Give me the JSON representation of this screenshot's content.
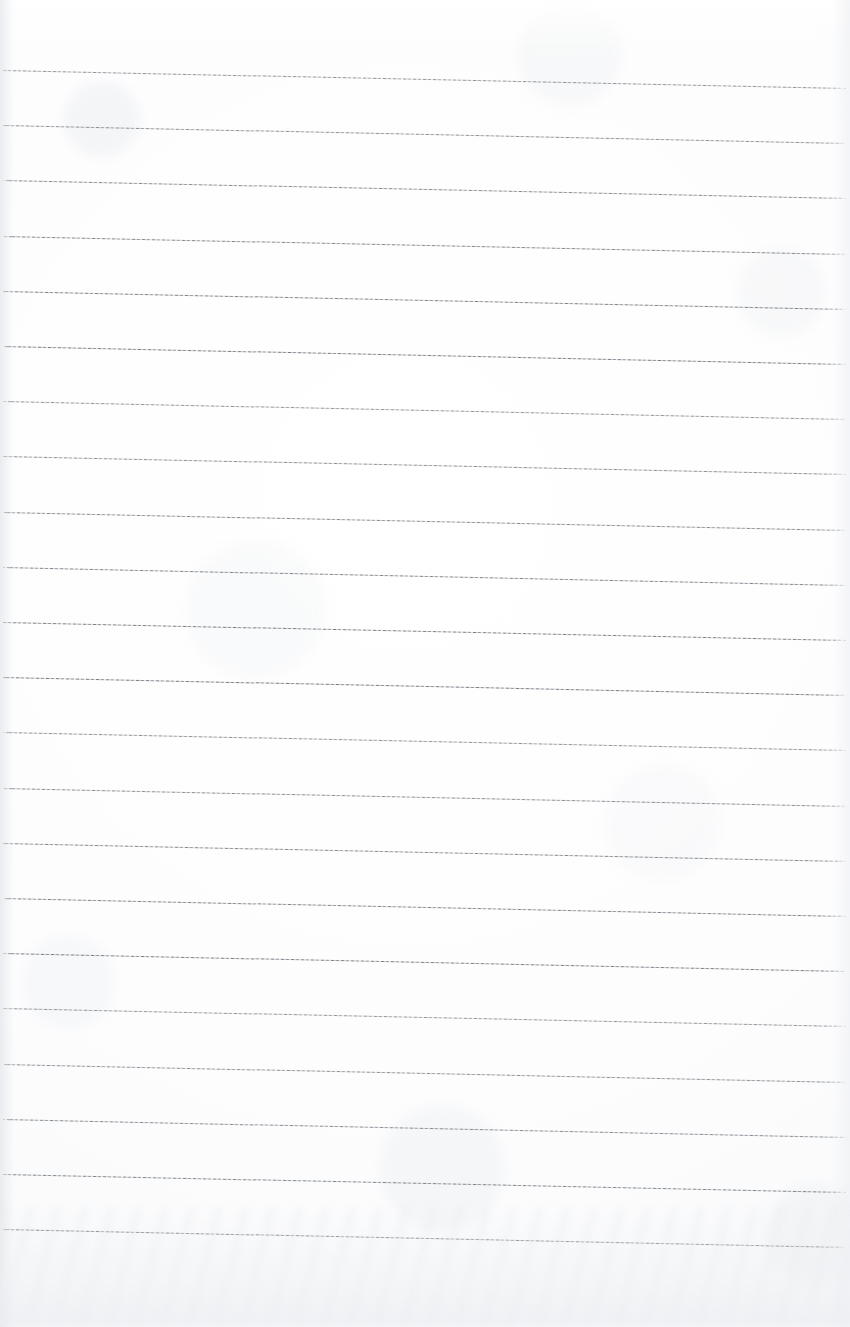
{
  "document": {
    "kind": "scanned-blank-lined-notebook-page",
    "page_width": 850,
    "page_height": 1327,
    "page_background_color": "#fdfdfd",
    "content_text": "",
    "has_handwriting": false,
    "has_header_text": false,
    "has_page_number": false
  },
  "ruling": {
    "style": "horizontal-ruled",
    "line_color": "#6d7178",
    "line_count": 22,
    "line_thickness_px": 1,
    "first_line_y": 70,
    "line_spacing_px": 55.2,
    "line_start_x": 3,
    "line_end_x": 846,
    "slant_drop_px": 18,
    "margin_rule": false,
    "line_y_positions": [
      70,
      125.2,
      180.4,
      235.6,
      290.8,
      346,
      401.2,
      456.4,
      511.6,
      566.8,
      622,
      677.2,
      732.4,
      787.6,
      842.8,
      898,
      953.2,
      1008.4,
      1063.6,
      1118.8,
      1174,
      1229.2
    ]
  },
  "scan_artifacts": {
    "bottom_shadow": true,
    "bottom_shadow_height_px": 120,
    "left_edge_shadow": true,
    "right_edge_shadow": true,
    "paper_mottling": true,
    "vignette": true,
    "artifact_tint": "#e9ecf0"
  }
}
